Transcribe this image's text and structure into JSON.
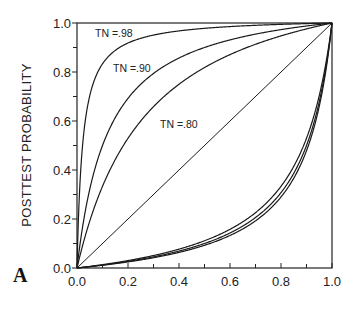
{
  "chart_data": {
    "type": "line",
    "title": "",
    "panel_label": "A",
    "xlabel": "",
    "ylabel": "POSTTEST PROBABILITY",
    "xlim": [
      0,
      1
    ],
    "ylim": [
      0,
      1
    ],
    "x_ticks": [
      "0.0",
      "0.2",
      "0.4",
      "0.6",
      "0.8",
      "1.0"
    ],
    "y_ticks": [
      "0.0",
      "0.2",
      "0.4",
      "0.6",
      "0.8",
      "1.0"
    ],
    "grid": false,
    "legend": "none (inline curve labels)",
    "assumed_sensitivity_TP": 0.9,
    "annotations": [
      {
        "text": "TN =.98",
        "x": 0.08,
        "y": 0.92
      },
      {
        "text": "TN =.90",
        "x": 0.22,
        "y": 0.8
      },
      {
        "text": "TN =.80",
        "x": 0.37,
        "y": 0.6
      }
    ],
    "series": [
      {
        "name": "TN=.98 (positive test)",
        "TN": 0.98,
        "test": "positive",
        "x": [
          0,
          0.02,
          0.05,
          0.1,
          0.2,
          0.3,
          0.4,
          0.5,
          0.6,
          0.7,
          0.8,
          0.9,
          1.0
        ],
        "y": [
          0,
          0.48,
          0.7,
          0.83,
          0.92,
          0.95,
          0.97,
          0.98,
          0.99,
          0.99,
          0.99,
          1.0,
          1.0
        ]
      },
      {
        "name": "TN=.90 (positive test)",
        "TN": 0.9,
        "test": "positive",
        "x": [
          0,
          0.02,
          0.05,
          0.1,
          0.2,
          0.3,
          0.4,
          0.5,
          0.6,
          0.7,
          0.8,
          0.9,
          1.0
        ],
        "y": [
          0,
          0.16,
          0.32,
          0.5,
          0.69,
          0.79,
          0.86,
          0.9,
          0.93,
          0.95,
          0.97,
          0.99,
          1.0
        ]
      },
      {
        "name": "TN=.80 (positive test)",
        "TN": 0.8,
        "test": "positive",
        "x": [
          0,
          0.02,
          0.05,
          0.1,
          0.2,
          0.3,
          0.4,
          0.5,
          0.6,
          0.7,
          0.8,
          0.9,
          1.0
        ],
        "y": [
          0,
          0.08,
          0.19,
          0.33,
          0.53,
          0.66,
          0.75,
          0.82,
          0.87,
          0.91,
          0.95,
          0.98,
          1.0
        ]
      },
      {
        "name": "Identity (no test)",
        "test": "none",
        "x": [
          0,
          1
        ],
        "y": [
          0,
          1
        ]
      },
      {
        "name": "TN=.80 (negative test)",
        "TN": 0.8,
        "test": "negative",
        "x": [
          0,
          0.1,
          0.2,
          0.3,
          0.4,
          0.5,
          0.6,
          0.7,
          0.8,
          0.9,
          0.95,
          1.0
        ],
        "y": [
          0,
          0.01,
          0.03,
          0.05,
          0.08,
          0.11,
          0.16,
          0.23,
          0.33,
          0.53,
          0.7,
          1.0
        ]
      },
      {
        "name": "TN=.90 (negative test)",
        "TN": 0.9,
        "test": "negative",
        "x": [
          0,
          0.1,
          0.2,
          0.3,
          0.4,
          0.5,
          0.6,
          0.7,
          0.8,
          0.9,
          0.95,
          1.0
        ],
        "y": [
          0,
          0.01,
          0.03,
          0.05,
          0.07,
          0.1,
          0.14,
          0.21,
          0.31,
          0.5,
          0.68,
          1.0
        ]
      },
      {
        "name": "TN=.98 (negative test)",
        "TN": 0.98,
        "test": "negative",
        "x": [
          0,
          0.1,
          0.2,
          0.3,
          0.4,
          0.5,
          0.6,
          0.7,
          0.8,
          0.9,
          0.95,
          1.0
        ],
        "y": [
          0,
          0.01,
          0.02,
          0.04,
          0.06,
          0.09,
          0.13,
          0.19,
          0.29,
          0.48,
          0.66,
          1.0
        ]
      }
    ]
  },
  "plot": {
    "ylabel": "POSTTEST PROBABILITY",
    "panel_label": "A",
    "curve_labels": [
      "TN =.98",
      "TN =.90",
      "TN =.80"
    ]
  }
}
